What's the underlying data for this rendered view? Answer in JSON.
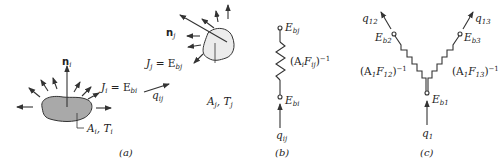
{
  "figure": {
    "panel_a": {
      "caption": "(a)",
      "surface_i": {
        "normal_label": "n",
        "normal_sub": "i",
        "radiosity_label_J": "J",
        "radiosity_sub_J": "i",
        "radiosity_eq": " = E",
        "radiosity_sub_E": "bi",
        "area_label": "A",
        "area_sub": "i",
        "temp_label": ", T",
        "temp_sub": "i",
        "fill_color": "#a9a9a9"
      },
      "exchange": {
        "q_label": "q",
        "q_sub": "ij"
      },
      "surface_j": {
        "normal_label": "n",
        "normal_sub": "j",
        "radiosity_label_J": "J",
        "radiosity_sub_J": "j",
        "radiosity_eq": " = E",
        "radiosity_sub_E": "bj",
        "area_label": "A",
        "area_sub": "j",
        "temp_label": ", T",
        "temp_sub": "j",
        "fill_color": "#ececec"
      }
    },
    "panel_b": {
      "caption": "(b)",
      "node_top": {
        "label": "E",
        "sub": "bj"
      },
      "node_bottom": {
        "label": "E",
        "sub": "bi"
      },
      "resistance": {
        "open": "(A",
        "sub1": "i",
        "mid": "F",
        "sub2": "ij",
        "close": ")",
        "exp": "−1"
      },
      "flow": {
        "label": "q",
        "sub": "ij"
      }
    },
    "panel_c": {
      "caption": "(c)",
      "node_center": {
        "label": "E",
        "sub": "b1"
      },
      "node_left": {
        "label": "E",
        "sub": "b2"
      },
      "node_right": {
        "label": "E",
        "sub": "b3"
      },
      "resistance_left": {
        "open": "(A",
        "sub1": "1",
        "mid": "F",
        "sub2": "12",
        "close": ")",
        "exp": "−1"
      },
      "resistance_right": {
        "open": "(A",
        "sub1": "1",
        "mid": "F",
        "sub2": "13",
        "close": ")",
        "exp": "−1"
      },
      "flow_in": {
        "label": "q",
        "sub": "1"
      },
      "flow_left": {
        "label": "q",
        "sub": "12"
      },
      "flow_right": {
        "label": "q",
        "sub": "13"
      }
    }
  }
}
